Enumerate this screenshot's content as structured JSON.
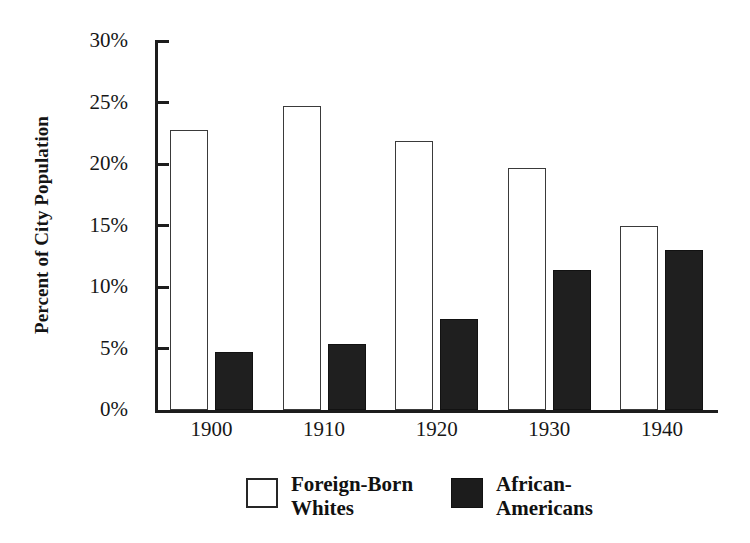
{
  "chart_data": {
    "type": "bar",
    "title": "",
    "xlabel": "",
    "ylabel": "Percent of City Population",
    "categories": [
      "1900",
      "1910",
      "1920",
      "1930",
      "1940"
    ],
    "series": [
      {
        "name": "Foreign-Born Whites",
        "style": "open",
        "values": [
          22.8,
          24.7,
          21.9,
          19.7,
          15.0
        ]
      },
      {
        "name": "African-Americans",
        "style": "filled",
        "values": [
          4.7,
          5.4,
          7.4,
          11.4,
          13.0
        ]
      }
    ],
    "ylim": [
      0,
      30
    ],
    "y_ticks": [
      0,
      5,
      10,
      15,
      20,
      25,
      30
    ],
    "y_tick_labels": [
      "0%",
      "5%",
      "10%",
      "15%",
      "20%",
      "25%",
      "30%"
    ],
    "grid": false,
    "legend_position": "bottom"
  },
  "axes": {
    "y_title": "Percent of City Population",
    "y_tick_labels": [
      "30%",
      "25%",
      "20%",
      "15%",
      "10%",
      "5%",
      "0%"
    ],
    "x_tick_labels": [
      "1900",
      "1910",
      "1920",
      "1930",
      "1940"
    ]
  },
  "legend": {
    "entries": [
      {
        "line1": "Foreign-Born",
        "line2": "Whites",
        "swatch": "open-square-icon"
      },
      {
        "line1": "African-",
        "line2": "Americans",
        "swatch": "filled-square-icon"
      }
    ]
  },
  "colors": {
    "open_bar_fill": "#ffffff",
    "open_bar_stroke": "#3a3a3a",
    "filled_bar": "#1f1f1f",
    "axis": "#1d1d1d",
    "text": "#171717",
    "background": "#ffffff"
  }
}
